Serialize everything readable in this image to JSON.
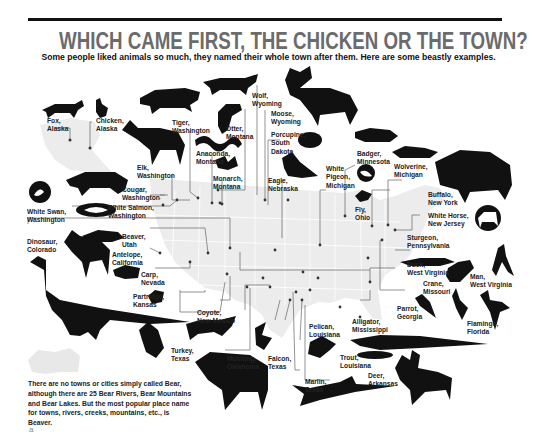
{
  "header": {
    "title": "WHICH CAME FIRST, THE CHICKEN OR THE TOWN?",
    "subtitle": "Some people liked animals so much, they named their whole town after them. Here are some beastly examples."
  },
  "labels": [
    {
      "id": "fox",
      "animal": "Fox,",
      "place": "Alaska"
    },
    {
      "id": "chicken",
      "animal": "Chicken,",
      "place": "Alaska"
    },
    {
      "id": "tiger",
      "animal": "Tiger,",
      "place": "Washington"
    },
    {
      "id": "wolf",
      "animal": "Wolf,",
      "place": "Wyoming"
    },
    {
      "id": "otter",
      "animal": "Otter,",
      "place": "Montana"
    },
    {
      "id": "moose",
      "animal": "Moose,",
      "place": "Wyoming"
    },
    {
      "id": "porcupine",
      "animal": "Porcupine,",
      "place": "South",
      "place2": "Dakota"
    },
    {
      "id": "elk",
      "animal": "Elk,",
      "place": "Washington"
    },
    {
      "id": "anaconda",
      "animal": "Anaconda,",
      "place": "Montana"
    },
    {
      "id": "monarch",
      "animal": "Monarch,",
      "place": "Montana"
    },
    {
      "id": "eagle",
      "animal": "Eagle,",
      "place": "Nebraska"
    },
    {
      "id": "white_pigeon",
      "animal": "White",
      "animal2": "Pigeon,",
      "place": "Michigan"
    },
    {
      "id": "badger",
      "animal": "Badger,",
      "place": "Minnesota"
    },
    {
      "id": "wolverine",
      "animal": "Wolverine,",
      "place": "Michigan"
    },
    {
      "id": "buffalo",
      "animal": "Buffalo,",
      "place": "New York"
    },
    {
      "id": "cougar",
      "animal": "Cougar,",
      "place": "Washington"
    },
    {
      "id": "white_salmon",
      "animal": "White Salmon,",
      "place": "Washington"
    },
    {
      "id": "white_swan",
      "animal": "White Swan,",
      "place": "Washington"
    },
    {
      "id": "fly",
      "animal": "Fly,",
      "place": "Ohio"
    },
    {
      "id": "white_horse",
      "animal": "White Horse,",
      "place": "New Jersey"
    },
    {
      "id": "sturgeon",
      "animal": "Sturgeon,",
      "place": "Pennsylvania"
    },
    {
      "id": "dinosaur",
      "animal": "Dinosaur,",
      "place": "Colorado"
    },
    {
      "id": "beaver",
      "animal": "Beaver,",
      "place": "Utah"
    },
    {
      "id": "antelope",
      "animal": "Antelope,",
      "place": "California"
    },
    {
      "id": "carp",
      "animal": "Carp,",
      "place": "Nevada"
    },
    {
      "id": "duck",
      "animal": "Duck,",
      "place": "West Virginia"
    },
    {
      "id": "man",
      "animal": "Man,",
      "place": "West Virginia"
    },
    {
      "id": "crane",
      "animal": "Crane,",
      "place": "Missouri"
    },
    {
      "id": "partridge",
      "animal": "Partridge,",
      "place": "Kansas"
    },
    {
      "id": "parrot",
      "animal": "Parrot,",
      "place": "Georgia"
    },
    {
      "id": "flamingo",
      "animal": "Flamingo,",
      "place": "Florida"
    },
    {
      "id": "coyote",
      "animal": "Coyote,",
      "place": "New Mexico"
    },
    {
      "id": "alligator",
      "animal": "Alligator,",
      "place": "Mississippi"
    },
    {
      "id": "pelican",
      "animal": "Pelican,",
      "place": "Louisiana"
    },
    {
      "id": "turkey",
      "animal": "Turkey,",
      "place": "Texas"
    },
    {
      "id": "mustang",
      "animal": "Mustang,",
      "place": "Oklahoma"
    },
    {
      "id": "falcon",
      "animal": "Falcon,",
      "place": "Texas"
    },
    {
      "id": "trout",
      "animal": "Trout,",
      "place": "Louisiana"
    },
    {
      "id": "deer",
      "animal": "Deer,",
      "place": "Arkansas"
    },
    {
      "id": "marlin",
      "animal": "Marlin,",
      "place": "Texas"
    }
  ],
  "note": "There are no towns or cities simply called Bear, although there are 25 Bear Rivers, Bear Mountains and Bear Lakes. But the most popular place name for towns, rivers, creeks, mountains, etc., is Beaver.",
  "page_marker": "a",
  "colors": {
    "title": "#6b6b6b",
    "map": "#ececec",
    "ink": "#111111",
    "line": "#555555"
  }
}
